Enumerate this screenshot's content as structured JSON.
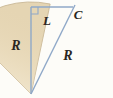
{
  "figure": {
    "type": "geometry-diagram",
    "background_color": "#fdfcf8",
    "sector": {
      "fill_color": "#e5d5b3",
      "edge_color": "#c9b896",
      "apex": {
        "x": 31,
        "y": 94
      },
      "radius": 92,
      "start_angle_deg": 225,
      "end_angle_deg": 282
    },
    "lines": {
      "color": "#8fa8c8",
      "vertical": {
        "x1": 31,
        "y1": 7,
        "x2": 31,
        "y2": 94
      },
      "horizontal": {
        "x1": 31,
        "y1": 7,
        "x2": 73,
        "y2": 7
      },
      "diagonal": {
        "x1": 31,
        "y1": 94,
        "x2": 75,
        "y2": 5
      }
    },
    "right_angle_marker": {
      "x": 31,
      "y": 7,
      "size": 7,
      "color": "#8fa8c8"
    }
  },
  "labels": {
    "radius_left": {
      "text": "R",
      "x": 16,
      "y": 50
    },
    "chord_top": {
      "text": "L",
      "x": 47,
      "y": 25
    },
    "point_c": {
      "text": "C",
      "x": 78,
      "y": 19
    },
    "radius_diagonal": {
      "text": "R",
      "x": 68,
      "y": 60
    }
  }
}
